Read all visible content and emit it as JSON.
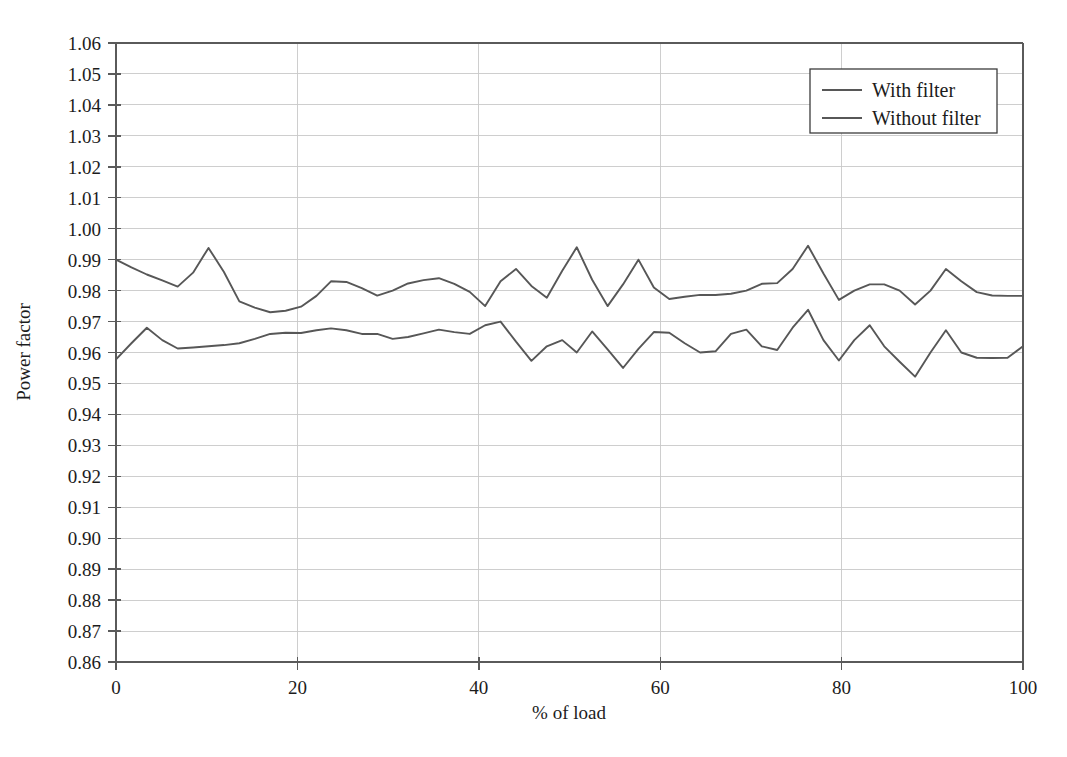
{
  "chart_data": {
    "type": "line",
    "title": "",
    "xlabel": "% of load",
    "ylabel": "Power factor",
    "xlim": [
      0,
      100
    ],
    "ylim": [
      0.86,
      1.06
    ],
    "grid": true,
    "legend_position": "top-right",
    "xticks": [
      0,
      20,
      40,
      60,
      80,
      100
    ],
    "xtick_labels": [
      "0",
      "20",
      "40",
      "60",
      "80",
      "100"
    ],
    "yticks": [
      0.86,
      0.87,
      0.88,
      0.89,
      0.9,
      0.91,
      0.92,
      0.93,
      0.94,
      0.95,
      0.96,
      0.97,
      0.98,
      0.99,
      1.0,
      1.01,
      1.02,
      1.03,
      1.04,
      1.05,
      1.06
    ],
    "ytick_labels": [
      "0.86",
      "0.87",
      "0.88",
      "0.89",
      "0.90",
      "0.91",
      "0.92",
      "0.93",
      "0.94",
      "0.95",
      "0.96",
      "0.97",
      "0.98",
      "0.99",
      "1.00",
      "1.01",
      "1.02",
      "1.03",
      "1.04",
      "1.05",
      "1.06"
    ],
    "line_color": "#575757",
    "grid_color": "#c9c9c9",
    "x": [
      0,
      1.7,
      3.4,
      5.1,
      6.8,
      8.5,
      10.2,
      11.9,
      13.6,
      15.3,
      17.0,
      18.7,
      20.4,
      22.1,
      23.7,
      25.4,
      27.1,
      28.8,
      30.5,
      32.2,
      33.9,
      35.6,
      37.3,
      39.0,
      40.7,
      42.4,
      44.1,
      45.8,
      47.5,
      49.2,
      50.8,
      52.5,
      54.2,
      55.9,
      57.6,
      59.3,
      61.0,
      62.7,
      64.4,
      66.1,
      67.8,
      69.5,
      71.2,
      72.9,
      74.6,
      76.3,
      78.0,
      79.7,
      81.4,
      83.1,
      84.7,
      86.4,
      88.1,
      89.8,
      91.5,
      93.2,
      94.9,
      96.6,
      98.3,
      100
    ],
    "series": [
      {
        "name": "With filter",
        "values": [
          0.99,
          0.9875,
          0.9852,
          0.9833,
          0.9813,
          0.9858,
          0.9938,
          0.986,
          0.9765,
          0.9745,
          0.973,
          0.9735,
          0.9748,
          0.9783,
          0.983,
          0.9828,
          0.9808,
          0.9784,
          0.98,
          0.9823,
          0.9834,
          0.984,
          0.9822,
          0.9796,
          0.975,
          0.983,
          0.987,
          0.9815,
          0.9777,
          0.9864,
          0.994,
          0.9835,
          0.975,
          0.982,
          0.99,
          0.981,
          0.9773,
          0.978,
          0.9786,
          0.9786,
          0.979,
          0.98,
          0.9822,
          0.9824,
          0.987,
          0.9945,
          0.9855,
          0.977,
          0.98,
          0.982,
          0.982,
          0.98,
          0.9755,
          0.98,
          0.987,
          0.983,
          0.9795,
          0.9784,
          0.9783,
          0.9783
        ]
      },
      {
        "name": "Without filter",
        "values": [
          0.9578,
          0.963,
          0.968,
          0.964,
          0.9613,
          0.9616,
          0.962,
          0.9624,
          0.963,
          0.9644,
          0.966,
          0.9664,
          0.9663,
          0.9672,
          0.9678,
          0.9672,
          0.966,
          0.966,
          0.9644,
          0.965,
          0.9662,
          0.9674,
          0.9666,
          0.966,
          0.9688,
          0.97,
          0.9635,
          0.9573,
          0.962,
          0.964,
          0.96,
          0.9668,
          0.961,
          0.955,
          0.9612,
          0.9666,
          0.9664,
          0.963,
          0.96,
          0.9604,
          0.966,
          0.9674,
          0.962,
          0.9608,
          0.968,
          0.9738,
          0.964,
          0.9574,
          0.964,
          0.9688,
          0.962,
          0.957,
          0.9522,
          0.96,
          0.9672,
          0.96,
          0.9583,
          0.9582,
          0.9583,
          0.962
        ]
      }
    ]
  },
  "legend": {
    "entries": [
      {
        "label": "With filter"
      },
      {
        "label": "Without filter"
      }
    ]
  },
  "axes": {
    "x_title": "% of load",
    "y_title": "Power factor"
  }
}
